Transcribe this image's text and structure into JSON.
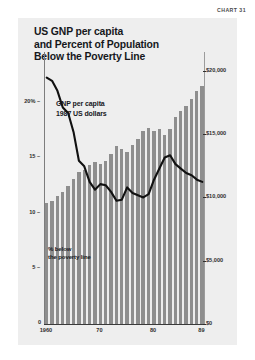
{
  "chart_label": "CHART 31",
  "title": {
    "line1": "US GNP per capita",
    "line2": "and Percent of Population",
    "line3": "Below the Poverty Line"
  },
  "annotations": {
    "bars_caption_line1": "GNP per capita",
    "bars_caption_line2": "1987 US dollars",
    "line_caption_line1": "% below",
    "line_caption_line2": "the poverty line"
  },
  "colors": {
    "panel_background": "#eeeeee",
    "bar_fill": "#8e8e8e",
    "line_stroke": "#111111",
    "text": "#16181c",
    "axis": "#7d7d7d"
  },
  "chart_data": {
    "type": "bar",
    "title": "US GNP per capita and Percent of Population Below the Poverty Line",
    "subtitle": "",
    "xlabel": "",
    "ylabel": "",
    "grid": false,
    "legend_position": "inside",
    "x": [
      1960,
      1961,
      1962,
      1963,
      1964,
      1965,
      1966,
      1967,
      1968,
      1969,
      1970,
      1971,
      1972,
      1973,
      1974,
      1975,
      1976,
      1977,
      1978,
      1979,
      1980,
      1981,
      1982,
      1983,
      1984,
      1985,
      1986,
      1987,
      1988,
      1989
    ],
    "categories": [
      "1960",
      "1961",
      "1962",
      "1963",
      "1964",
      "1965",
      "1966",
      "1967",
      "1968",
      "1969",
      "1970",
      "1971",
      "1972",
      "1973",
      "1974",
      "1975",
      "1976",
      "1977",
      "1978",
      "1979",
      "1980",
      "1981",
      "1982",
      "1983",
      "1984",
      "1985",
      "1986",
      "1987",
      "1988",
      "1989"
    ],
    "xtick_labels": [
      "1960",
      "70",
      "80",
      "89"
    ],
    "xtick_values": [
      1960,
      1970,
      1980,
      1989
    ],
    "left_axis": {
      "label": "% below the poverty line",
      "tick_labels": [
        "20%",
        "15",
        "10",
        "5"
      ],
      "tick_values": [
        20,
        15,
        10,
        5
      ],
      "ylim": [
        0,
        24.5
      ]
    },
    "right_axis": {
      "label": "GNP per capita, 1987 US dollars",
      "tick_labels": [
        "$20,000",
        "$15,000",
        "$10,000",
        "$5,000",
        "$0"
      ],
      "tick_values": [
        20000,
        15000,
        10000,
        5000,
        0
      ],
      "ylim": [
        0,
        21500
      ]
    },
    "series": [
      {
        "name": "GNP per capita",
        "type": "bar",
        "axis": "right",
        "unit": "1987 US dollars",
        "values": [
          9600,
          9700,
          10150,
          10450,
          10900,
          11450,
          12000,
          12150,
          12600,
          12800,
          12650,
          12900,
          13450,
          14050,
          13800,
          13600,
          14150,
          14600,
          15250,
          15500,
          15250,
          15450,
          14950,
          15450,
          16400,
          16850,
          17250,
          17750,
          18400,
          18800
        ]
      },
      {
        "name": "% below the poverty line",
        "type": "line",
        "axis": "left",
        "unit": "percent",
        "values": [
          22.2,
          21.9,
          21.0,
          19.5,
          19.0,
          17.3,
          14.7,
          14.2,
          12.8,
          12.1,
          12.6,
          12.5,
          11.9,
          11.1,
          11.2,
          12.3,
          11.8,
          11.6,
          11.4,
          11.7,
          13.0,
          14.0,
          15.0,
          15.2,
          14.4,
          14.0,
          13.6,
          13.4,
          13.0,
          12.8
        ]
      }
    ]
  }
}
